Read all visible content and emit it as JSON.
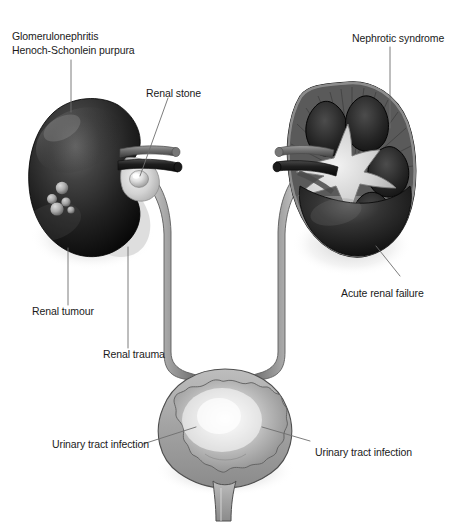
{
  "figure": {
    "background_color": "#ffffff",
    "width": 451,
    "height": 527
  },
  "labels": {
    "glomerulonephritis": {
      "line1": "Glomerulonephritis",
      "line2": "Henoch-Schonlein purpura"
    },
    "renal_stone": "Renal stone",
    "nephrotic_syndrome": "Nephrotic syndrome",
    "acute_renal_failure": "Acute renal failure",
    "renal_tumour": "Renal tumour",
    "renal_trauma": "Renal trauma",
    "uti_left": "Urinary tract infection",
    "uti_right": "Urinary tract infection"
  },
  "anatomy": {
    "left_kidney": "left-kidney-whole",
    "right_kidney": "right-kidney-cross-section",
    "left_ureter": "left-ureter",
    "right_ureter": "right-ureter",
    "bladder": "urinary-bladder",
    "urethra": "urethra",
    "renal_stone_marker": "renal-stone",
    "tumour_nodules": "renal-tumour-nodules",
    "renal_vessels": "renal-vessels"
  },
  "colors": {
    "kidney_dark": "#2a2a2a",
    "kidney_darkest": "#0d0d0d",
    "organ_mid_grey": "#8f8f8f",
    "organ_light_grey": "#c9c9c9",
    "organ_pale": "#e3e3e3",
    "outline": "#3a3a3a",
    "leader_line": "#6e6e6e",
    "text": "#1a1a1a"
  }
}
